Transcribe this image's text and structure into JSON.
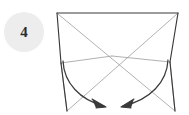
{
  "step": {
    "number": "4",
    "badge_shape": "circle",
    "badge_color": "#ededed",
    "badge_text_color": "#2b2b2b"
  },
  "diagram": {
    "title": "",
    "kind": "origami-fold-step",
    "colors": {
      "edge_solid": "#3a3a3a",
      "crease_light": "#a8a8a8",
      "arrow": "#3a3a3a",
      "background": "#ffffff"
    },
    "elements": {
      "top_edge_label": "top edge",
      "left_edge_label": "left edge",
      "right_edge_label": "right edge",
      "diagonal_label": "crease diagonal",
      "horizontal_crease_label": "horizontal crease",
      "arrow_left_label": "fold left flap inward",
      "arrow_right_label": "fold right flap inward"
    },
    "geometry": {
      "top_left": [
        57,
        13
      ],
      "top_right": [
        178,
        13
      ],
      "bottom_left": [
        67,
        111
      ],
      "bottom_right": [
        175,
        111
      ],
      "center": [
        112,
        57
      ],
      "waist_left": [
        61,
        63
      ],
      "waist_right": [
        170,
        62
      ]
    }
  }
}
